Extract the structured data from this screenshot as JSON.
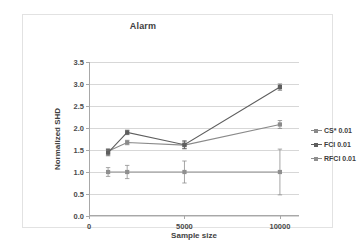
{
  "chart_data": {
    "type": "line",
    "title": "Alarm",
    "xlabel": "Sample size",
    "ylabel": "Normalized SHD",
    "xlim": [
      0,
      11000
    ],
    "ylim": [
      0.0,
      3.5
    ],
    "grid": true,
    "legend_position": "right",
    "xticks": [
      {
        "value": 0,
        "label": "0"
      },
      {
        "value": 5000,
        "label": "5000"
      },
      {
        "value": 10000,
        "label": "10000"
      }
    ],
    "yticks": [
      {
        "value": 0.0,
        "label": "0.0"
      },
      {
        "value": 0.5,
        "label": "0.5"
      },
      {
        "value": 1.0,
        "label": "1.0"
      },
      {
        "value": 1.5,
        "label": "1.5"
      },
      {
        "value": 2.0,
        "label": "2.0"
      },
      {
        "value": 2.5,
        "label": "2.5"
      },
      {
        "value": 3.0,
        "label": "3.0"
      },
      {
        "value": 3.5,
        "label": "3.5"
      }
    ],
    "x": [
      1000,
      2000,
      5000,
      10000
    ],
    "series": [
      {
        "name": "CS* 0.01",
        "color": "#8a8a8a",
        "marker": "square",
        "values": [
          1.47,
          1.67,
          1.61,
          2.08
        ],
        "errors": [
          0.06,
          0.05,
          0.08,
          0.09
        ]
      },
      {
        "name": "FCI 0.01",
        "color": "#5e5e5e",
        "marker": "square",
        "values": [
          1.44,
          1.9,
          1.62,
          2.93
        ],
        "errors": [
          0.07,
          0.05,
          0.09,
          0.07
        ]
      },
      {
        "name": "RFCI 0.01",
        "color": "#8f8f8f",
        "marker": "square",
        "values": [
          1.0,
          1.0,
          1.0,
          1.0
        ],
        "errors": [
          0.1,
          0.15,
          0.25,
          0.52
        ]
      }
    ]
  },
  "legend": {
    "entries": [
      {
        "label": "CS* 0.01"
      },
      {
        "label": "FCI 0.01"
      },
      {
        "label": "RFCI 0.01"
      }
    ]
  }
}
